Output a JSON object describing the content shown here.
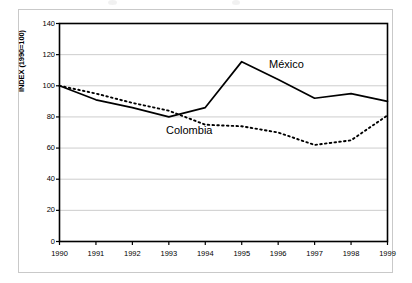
{
  "chart_data": {
    "type": "line",
    "title": "",
    "xlabel": "",
    "ylabel": "INDEX (1990=100)",
    "x": [
      1990,
      1991,
      1992,
      1993,
      1994,
      1995,
      1996,
      1997,
      1998,
      1999
    ],
    "categories": [
      "1990",
      "1991",
      "1992",
      "1993",
      "1994",
      "1995",
      "1996",
      "1997",
      "1998",
      "1999"
    ],
    "xlim": [
      1990,
      1999
    ],
    "ylim": [
      0,
      140
    ],
    "yticks": [
      0,
      20,
      40,
      60,
      80,
      100,
      120,
      140
    ],
    "ytick_labels": [
      "0",
      "20",
      "40",
      "60",
      "80",
      "100",
      "120",
      "140"
    ],
    "grid": true,
    "grid_axis": "y",
    "grid_color": "#c0c0c0",
    "legend": "inline-annotations",
    "series": [
      {
        "name": "México",
        "style": "solid",
        "color": "#000000",
        "values": [
          100,
          91,
          86,
          80,
          86,
          115.5,
          104,
          92,
          95,
          90
        ]
      },
      {
        "name": "Colombia",
        "style": "dotted",
        "color": "#000000",
        "values": [
          100,
          95,
          89,
          84,
          75,
          74,
          70,
          62,
          65,
          81
        ]
      }
    ],
    "annotations": [
      {
        "text": "México",
        "x": 1996.4,
        "y": 108
      },
      {
        "text": "Colombia",
        "x": 1993.2,
        "y": 69
      }
    ]
  },
  "axes": {
    "y_axis_title": "INDEX (1990=100)",
    "y_tick_labels": [
      "140",
      "120",
      "100",
      "80",
      "60",
      "40",
      "20",
      "0"
    ],
    "x_tick_labels": [
      "1990",
      "1991",
      "1992",
      "1993",
      "1994",
      "1995",
      "1996",
      "1997",
      "1998",
      "1999"
    ]
  },
  "colors": {
    "plot_border": "#000000",
    "gridline": "#c0c0c0",
    "series_line": "#000000",
    "outer_frame": "#c9c9c9",
    "background": "#ffffff"
  }
}
